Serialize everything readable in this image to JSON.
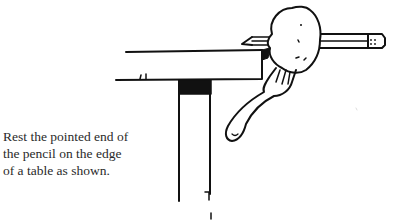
{
  "page": {
    "background": "#ffffff",
    "ink_color": "#111111"
  },
  "caption": {
    "lines": [
      "Rest the pointed end of",
      "the pencil on the edge",
      "of a table as shown."
    ]
  },
  "illustration": {
    "elements": [
      "table-top",
      "table-leg",
      "pencil",
      "potato",
      "fork"
    ]
  }
}
